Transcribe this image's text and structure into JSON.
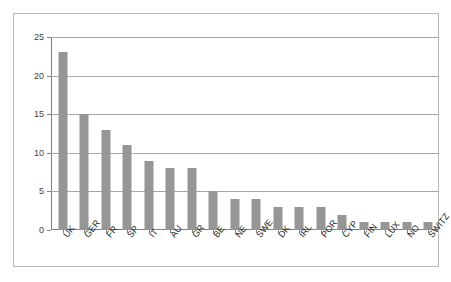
{
  "chart_data": {
    "type": "bar",
    "title": "",
    "subtitle": "",
    "xlabel": "",
    "ylabel": "",
    "ylim": [
      0,
      25
    ],
    "yticks": [
      0,
      5,
      10,
      15,
      20,
      25
    ],
    "grid": true,
    "legend": false,
    "legend_position": "none",
    "orientation": "vertical",
    "bar_color": "#969696",
    "categories": [
      "UK",
      "GER",
      "FR",
      "SP",
      "IT",
      "AU",
      "GR",
      "BE",
      "NE",
      "SWE",
      "DK",
      "IRL",
      "POR",
      "CYP",
      "FIN",
      "LUX",
      "NO",
      "SWITZ"
    ],
    "values": [
      23,
      15,
      13,
      11,
      9,
      8,
      8,
      5,
      4,
      4,
      3,
      3,
      3,
      2,
      1,
      1,
      1,
      1
    ]
  },
  "axes": {
    "y_tick_labels": [
      "0",
      "5",
      "10",
      "15",
      "20",
      "25"
    ]
  }
}
